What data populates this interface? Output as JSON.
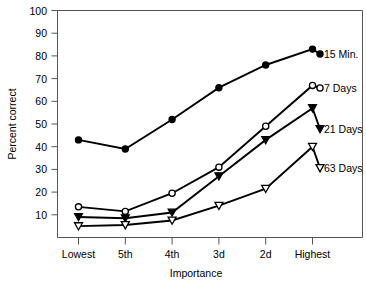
{
  "chart_data": {
    "type": "line",
    "title": "",
    "xlabel": "Importance",
    "ylabel": "Percent correct",
    "categories": [
      "Lowest",
      "5th",
      "4th",
      "3d",
      "2d",
      "Highest"
    ],
    "ylim": [
      0,
      100
    ],
    "yticks": [
      10,
      20,
      30,
      40,
      50,
      60,
      70,
      80,
      90,
      100
    ],
    "ytick_labels": [
      "10",
      "20",
      "30",
      "40",
      "50",
      "60",
      "70",
      "80",
      "90",
      "100"
    ],
    "grid": false,
    "legend_position": "right-inline-labels",
    "series": [
      {
        "name": "15 Min.",
        "label": "15 Min.",
        "marker": "filled-circle",
        "values": [
          43,
          39,
          52,
          66,
          76,
          83
        ]
      },
      {
        "name": "7 Days",
        "label": "7 Days",
        "marker": "open-circle",
        "values": [
          13.5,
          11.5,
          19.5,
          31,
          49,
          67
        ]
      },
      {
        "name": "21 Days",
        "label": "21 Days",
        "marker": "filled-triangle",
        "values": [
          9,
          8.5,
          11,
          27,
          43,
          57
        ]
      },
      {
        "name": "63 Days",
        "label": "63 Days",
        "marker": "open-triangle",
        "values": [
          5,
          5.5,
          7.5,
          14,
          21.5,
          40
        ]
      }
    ]
  },
  "axis": {
    "ylabel": "Percent correct",
    "xlabel": "Importance",
    "ytick_0": "10",
    "ytick_1": "20",
    "ytick_2": "30",
    "ytick_3": "40",
    "ytick_4": "50",
    "ytick_5": "60",
    "ytick_6": "70",
    "ytick_7": "80",
    "ytick_8": "90",
    "ytick_9": "100",
    "xtick_0": "Lowest",
    "xtick_1": "5th",
    "xtick_2": "4th",
    "xtick_3": "3d",
    "xtick_4": "2d",
    "xtick_5": "Highest"
  },
  "series_labels": {
    "s0": "15 Min.",
    "s1": "7 Days",
    "s2": "21 Days",
    "s3": "63 Days"
  }
}
